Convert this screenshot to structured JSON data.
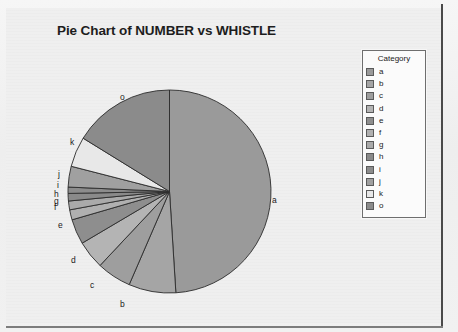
{
  "chart_title": "Pie Chart of NUMBER vs WHISTLE",
  "legend": {
    "title": "Category",
    "entries": [
      {
        "label": "a",
        "color": "#9a9a9a"
      },
      {
        "label": "b",
        "color": "#a5a5a5"
      },
      {
        "label": "c",
        "color": "#9e9e9e"
      },
      {
        "label": "d",
        "color": "#b4b4b4"
      },
      {
        "label": "e",
        "color": "#8e8e8e"
      },
      {
        "label": "f",
        "color": "#b0b0b0"
      },
      {
        "label": "g",
        "color": "#aaaaaa"
      },
      {
        "label": "h",
        "color": "#8a8a8a"
      },
      {
        "label": "i",
        "color": "#8c8c8c"
      },
      {
        "label": "j",
        "color": "#a0a0a0"
      },
      {
        "label": "k",
        "color": "#e8e8e8"
      },
      {
        "label": "o",
        "color": "#8b8b8b"
      }
    ]
  },
  "chart_data": {
    "type": "pie",
    "title": "Pie Chart of NUMBER vs WHISTLE",
    "xlabel": "",
    "ylabel": "",
    "legend_title": "Category",
    "legend_position": "right",
    "start_angle_deg": 0,
    "direction": "clockwise",
    "categories": [
      "a",
      "b",
      "c",
      "d",
      "e",
      "f",
      "g",
      "h",
      "i",
      "j",
      "k",
      "o"
    ],
    "values": [
      49.0,
      7.5,
      5.5,
      4.5,
      4.0,
      1.6,
      1.4,
      1.2,
      1.0,
      3.3,
      4.8,
      16.2
    ],
    "percents": [
      49.0,
      7.5,
      5.5,
      4.5,
      4.0,
      1.6,
      1.4,
      1.2,
      1.0,
      3.3,
      4.8,
      16.2
    ],
    "slice_colors": [
      "#9a9a9a",
      "#a5a5a5",
      "#9e9e9e",
      "#b4b4b4",
      "#8e8e8e",
      "#b0b0b0",
      "#aaaaaa",
      "#8a8a8a",
      "#8c8c8c",
      "#a0a0a0",
      "#e8e8e8",
      "#8b8b8b"
    ],
    "slice_labels": [
      "a",
      "b",
      "c",
      "d",
      "e",
      "f",
      "g",
      "h",
      "i",
      "j",
      "k",
      "o"
    ],
    "grid": false
  },
  "slice_label_positions": [
    {
      "label": "a",
      "x": 272,
      "y": 196
    },
    {
      "label": "b",
      "x": 120,
      "y": 300
    },
    {
      "label": "c",
      "x": 90,
      "y": 281
    },
    {
      "label": "d",
      "x": 71,
      "y": 256
    },
    {
      "label": "e",
      "x": 58,
      "y": 221
    },
    {
      "label": "f",
      "x": 54,
      "y": 203
    },
    {
      "label": "g",
      "x": 54,
      "y": 197
    },
    {
      "label": "h",
      "x": 54,
      "y": 190
    },
    {
      "label": "i",
      "x": 57,
      "y": 181
    },
    {
      "label": "j",
      "x": 58,
      "y": 170
    },
    {
      "label": "k",
      "x": 70,
      "y": 138
    },
    {
      "label": "o",
      "x": 120,
      "y": 93
    }
  ]
}
